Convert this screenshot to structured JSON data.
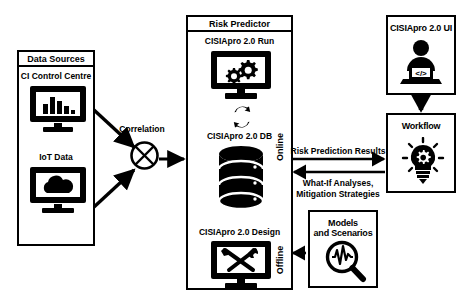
{
  "diagram": {
    "colors": {
      "stroke": "#000000",
      "background": "#ffffff"
    },
    "data_sources": {
      "title": "Data Sources",
      "items": [
        {
          "label": "CI Control Centre",
          "icon": "bar-chart-monitor-icon"
        },
        {
          "label": "IoT Data",
          "icon": "cloud-monitor-icon"
        }
      ]
    },
    "correlation": {
      "label": "Correlation",
      "icon": "crossed-circle-icon"
    },
    "risk_predictor": {
      "title": "Risk Predictor",
      "online_label": "Online",
      "offline_label": "Offline",
      "run": {
        "label": "CISIApro 2.0 Run",
        "icon": "gears-monitor-icon"
      },
      "sync": {
        "icon": "sync-arrows-icon"
      },
      "db": {
        "label": "CISIApro 2.0 DB",
        "icon": "database-icon"
      },
      "design": {
        "label": "CISIApro 2.0 Design",
        "icon": "tools-monitor-icon"
      }
    },
    "ui": {
      "title": "CISIApro 2.0 UI",
      "icon": "developer-laptop-icon"
    },
    "workflow": {
      "title": "Workflow",
      "icon": "lightbulb-gear-icon"
    },
    "models": {
      "title_line1": "Models",
      "title_line2": "and Scenarios",
      "icon": "magnifier-waveform-icon"
    },
    "flows": [
      {
        "label": "Risk Prediction Results",
        "direction": "right"
      },
      {
        "label_line1": "What-If Analyses,",
        "label_line2": "Mitigation Strategies",
        "direction": "left"
      }
    ]
  }
}
